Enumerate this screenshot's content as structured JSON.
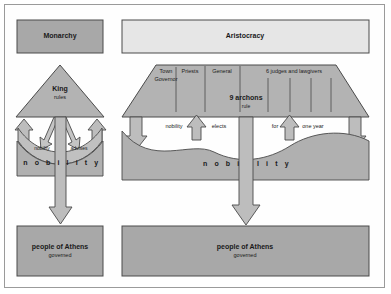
{
  "diagram": {
    "title_hidden": "",
    "colors": {
      "box_fill_dark": "#a8a8a8",
      "box_fill_light": "#e6e6e6",
      "shape_fill": "#b3b3b3",
      "band_fill": "#b0b0b0",
      "arrow_fill": "#bdbdbd",
      "stroke": "#4a4a4a",
      "frame_stroke": "#9a9a9a",
      "text": "#1a1a1a",
      "page_bg": "#ffffff"
    },
    "left_column": {
      "header": {
        "label": "Monarchy"
      },
      "pyramid": {
        "title": "King",
        "subtitle": "rules"
      },
      "relation_band": {
        "left_word": "nobility",
        "right_word": "advises"
      },
      "nobility_band": {
        "label": "n o b i l i t y"
      },
      "bottom": {
        "title": "people of Athens",
        "subtitle": "governed"
      }
    },
    "right_column": {
      "header": {
        "label": "Aristocracy"
      },
      "trapezoid": {
        "offices": [
          {
            "line1": "Town",
            "line2": "Governor"
          },
          {
            "line1": "Priests",
            "line2": ""
          },
          {
            "line1": "General",
            "line2": ""
          },
          {
            "line1": "6 judges and lawgivers",
            "line2": ""
          }
        ],
        "title": "9 archons",
        "subtitle": "rule"
      },
      "relation_row": {
        "word1": "nobility",
        "word2": "elects",
        "word3": "for",
        "word4": "one year"
      },
      "nobility_band": {
        "label_left": "n o b i",
        "label_right": "l i t y"
      },
      "bottom": {
        "title": "people of Athens",
        "subtitle": "governed"
      }
    }
  }
}
